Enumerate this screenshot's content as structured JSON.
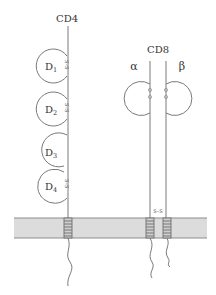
{
  "diagram": {
    "colors": {
      "line": "#7a7a7a",
      "membrane_fill": "#dcdcdc",
      "membrane_edge": "#8c8c8c",
      "coil": "#6e6e6e",
      "text": "#333333"
    },
    "cd4": {
      "label": "CD4",
      "domains": [
        {
          "base": "D",
          "sub": "1"
        },
        {
          "base": "D",
          "sub": "2"
        },
        {
          "base": "D",
          "sub": "3"
        },
        {
          "base": "D",
          "sub": "4"
        }
      ],
      "disulfide_label": "S–S"
    },
    "cd8": {
      "label": "CD8",
      "alpha_label": "α",
      "beta_label": "β",
      "disulfide_label": "S–S",
      "interchain_bond_label": "S–S"
    },
    "membrane": {
      "name": "plasma membrane"
    }
  }
}
